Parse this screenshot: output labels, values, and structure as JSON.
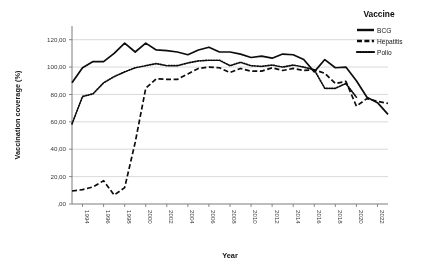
{
  "chart_data": {
    "type": "line",
    "title": "",
    "xlabel": "Year",
    "ylabel": "Vaccination coverage (%)",
    "legend_title": "Vaccine",
    "legend_position": "right",
    "grid": true,
    "xlim": [
      1993,
      2023
    ],
    "ylim": [
      0,
      130
    ],
    "y_ticks": [
      0,
      20,
      40,
      60,
      80,
      100,
      120
    ],
    "y_tick_labels": [
      ",00",
      "20,00",
      "40,00",
      "60,00",
      "80,00",
      "100,00",
      "120,00"
    ],
    "x_ticks": [
      1994,
      1996,
      1998,
      2000,
      2002,
      2004,
      2006,
      2008,
      2010,
      2012,
      2014,
      2016,
      2018,
      2020,
      2022
    ],
    "x_tick_labels": [
      "1994",
      "1996",
      "1998",
      "2000",
      "2002",
      "2004",
      "2006",
      "2008",
      "2010",
      "2012",
      "2014",
      "2016",
      "2018",
      "2020",
      "2022"
    ],
    "x": [
      1993,
      1994,
      1995,
      1996,
      1997,
      1998,
      1999,
      2000,
      2001,
      2002,
      2003,
      2004,
      2005,
      2006,
      2007,
      2008,
      2009,
      2010,
      2011,
      2012,
      2013,
      2014,
      2015,
      2016,
      2017,
      2018,
      2019,
      2020,
      2021,
      2022,
      2023
    ],
    "series": [
      {
        "name": "BCG",
        "style": "solid",
        "color": "#111111",
        "x": [
          1993,
          1994,
          1995,
          1996,
          1997,
          1998,
          1999,
          2000,
          2001,
          2002,
          2003,
          2004,
          2005,
          2006,
          2007,
          2008,
          2009,
          2010,
          2011,
          2012,
          2013,
          2014,
          2015,
          2016,
          2017,
          2018,
          2019,
          2020,
          2021,
          2022,
          2023
        ],
        "values": [
          88.5,
          99.5,
          104.0,
          104.0,
          110.0,
          117.5,
          111.0,
          117.5,
          112.5,
          112.0,
          111.0,
          109.0,
          112.5,
          114.5,
          111.0,
          111.0,
          109.5,
          107.0,
          108.0,
          106.5,
          109.5,
          109.0,
          105.5,
          96.5,
          105.5,
          99.5,
          100.0,
          90.0,
          78.0,
          74.0,
          65.5
        ]
      },
      {
        "name": "Hepatitis",
        "style": "dashed",
        "color": "#111111",
        "x": [
          1993,
          1994,
          1995,
          1996,
          1997,
          1998,
          1999,
          2000,
          2001,
          2002,
          2003,
          2004,
          2005,
          2006,
          2007,
          2008,
          2009,
          2010,
          2011,
          2012,
          2013,
          2014,
          2015,
          2016,
          2017,
          2018,
          2019,
          2020,
          2021,
          2022,
          2023
        ],
        "values": [
          9.5,
          10.5,
          12.5,
          17.0,
          6.5,
          12.0,
          45.0,
          84.5,
          91.5,
          91.0,
          91.0,
          95.0,
          99.0,
          100.0,
          99.5,
          96.0,
          99.0,
          97.0,
          97.0,
          99.5,
          97.5,
          99.0,
          97.5,
          98.0,
          95.5,
          88.0,
          89.5,
          71.5,
          77.0,
          75.0,
          73.5
        ]
      },
      {
        "name": "Polio",
        "style": "dotted",
        "color": "#111111",
        "x": [
          1993,
          1994,
          1995,
          1996,
          1997,
          1998,
          1999,
          2000,
          2001,
          2002,
          2003,
          2004,
          2005,
          2006,
          2007,
          2008,
          2009,
          2010,
          2011,
          2012,
          2013,
          2014,
          2015,
          2016,
          2017,
          2018,
          2019,
          2020,
          2021,
          2022,
          2023
        ],
        "values": [
          58.5,
          78.5,
          80.5,
          88.5,
          93.0,
          96.5,
          99.5,
          101.0,
          102.5,
          101.0,
          101.0,
          103.0,
          104.5,
          105.0,
          105.0,
          101.0,
          103.5,
          101.0,
          100.5,
          101.5,
          100.0,
          101.5,
          100.0,
          98.0,
          84.5,
          84.5,
          88.0,
          78.0,
          null,
          null,
          null
        ]
      }
    ]
  },
  "legend": {
    "title": "Vaccine",
    "items": [
      {
        "label": "BCG",
        "style": "solid"
      },
      {
        "label": "Hepatitis",
        "style": "dashed"
      },
      {
        "label": "Polio",
        "style": "dotted"
      }
    ]
  },
  "axes": {
    "x_title": "Year",
    "y_title": "Vaccination coverage (%)"
  }
}
